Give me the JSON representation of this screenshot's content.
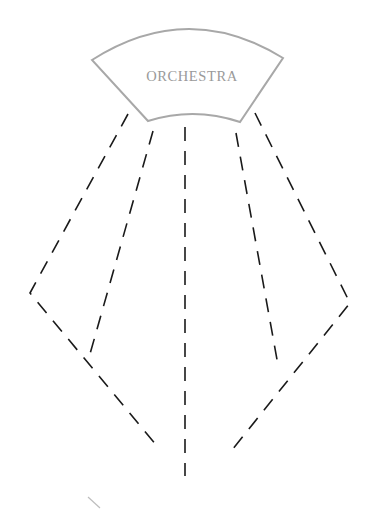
{
  "diagram": {
    "orchestra": {
      "label": "ORCHESTRA",
      "outline_color": "#a8a8a8",
      "text_color": "#9a9a9a",
      "shape": {
        "top_left": [
          92,
          60
        ],
        "top_right": [
          283,
          58
        ],
        "top_arc_peak_y": 29,
        "bottom_left": [
          148,
          121
        ],
        "bottom_right": [
          240,
          122
        ],
        "bottom_arc_peak_y": 114
      }
    },
    "line_color": "#1a1a1a",
    "dashed_paths": [
      {
        "name": "outer-left-path",
        "points": [
          [
            128,
            114
          ],
          [
            30,
            293
          ],
          [
            157,
            446
          ]
        ]
      },
      {
        "name": "inner-left-path",
        "points": [
          [
            153,
            131
          ],
          [
            90,
            354
          ]
        ]
      },
      {
        "name": "center-path",
        "points": [
          [
            185,
            127
          ],
          [
            185,
            476
          ]
        ]
      },
      {
        "name": "inner-right-path",
        "points": [
          [
            236,
            133
          ],
          [
            278,
            365
          ]
        ]
      },
      {
        "name": "outer-right-path",
        "points": [
          [
            255,
            113
          ],
          [
            350,
            303
          ],
          [
            228,
            455
          ]
        ]
      }
    ],
    "stray_mark": {
      "points": [
        [
          88,
          497
        ],
        [
          100,
          508
        ]
      ],
      "color": "#bdbdbd"
    }
  }
}
